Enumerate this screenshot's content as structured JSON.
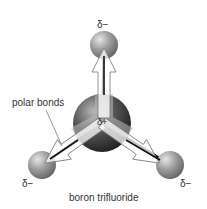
{
  "diagram": {
    "title": "boron trifluoride",
    "callout": "polar bonds",
    "charges": {
      "top": "δ−",
      "center": "δ+",
      "bottom_left": "δ−",
      "bottom_right": "δ−"
    },
    "colors": {
      "outer_atom": "#9a9a9a",
      "center_atom": "#555555",
      "bond": "#111111",
      "arrow_fill": "#ffffff"
    }
  }
}
